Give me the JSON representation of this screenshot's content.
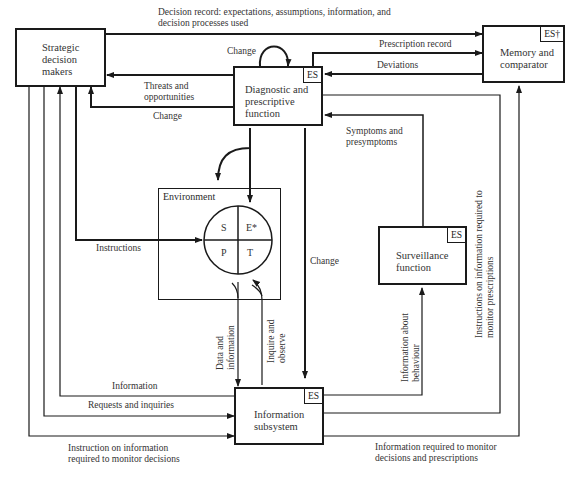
{
  "nodes": {
    "strategic": {
      "label": "Strategic decision makers"
    },
    "memory": {
      "label": "Memory and comparator",
      "tag": "ES†"
    },
    "diagnostic": {
      "label": "Diagnostic and prescriptive function",
      "tag": "ES"
    },
    "environment": {
      "label": "Environment",
      "quadrants": [
        "S",
        "E*",
        "P",
        "T"
      ]
    },
    "surveillance": {
      "label": "Surveillance function",
      "tag": "ES"
    },
    "information": {
      "label": "Information subsystem",
      "tag": "ES"
    }
  },
  "edges": {
    "decision_record": "Decision record: expectations, assumptions, information, and decision processes used",
    "change_loop": "Change",
    "prescription_record": "Prescription record",
    "deviations": "Deviations",
    "threats": "Threats and opportunities",
    "change_strategic": "Change",
    "symptoms": "Symptoms and presymptoms",
    "instructions": "Instructions",
    "change_info": "Change",
    "data_information": "Data and information",
    "inquire_observe": "Inquire and observe",
    "info_behaviour": "Information about behaviour",
    "instructions_monitor_prescriptions": "Instructions on information required to monitor prescriptions",
    "information": "Information",
    "requests": "Requests and inquiries",
    "instruction_monitor_decisions": "Instruction on information required to monitor decisions",
    "info_monitor_decisions_prescriptions": "Information required to monitor decisions and prescriptions"
  }
}
